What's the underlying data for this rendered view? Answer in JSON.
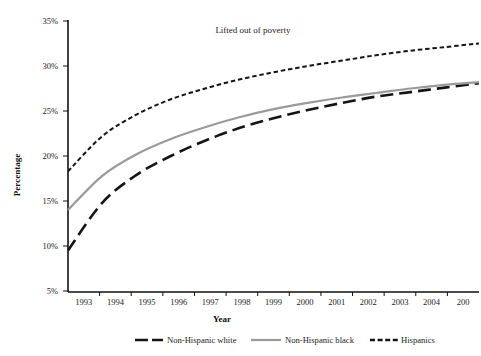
{
  "chart_data": {
    "type": "line",
    "title": "",
    "annotation": "Lifted out of poverty",
    "xlabel": "Year",
    "ylabel": "Percentage",
    "grid": false,
    "legend_position": "bottom",
    "ylim": [
      5,
      35
    ],
    "ytick_labels": [
      "35%",
      "30%",
      "25%",
      "20%",
      "15%",
      "10%",
      "5%"
    ],
    "ytick_values": [
      35,
      30,
      25,
      20,
      15,
      10,
      5
    ],
    "categories": [
      "1993",
      "1994",
      "1995",
      "1996",
      "1997",
      "1998",
      "1999",
      "2000",
      "2001",
      "2002",
      "2003",
      "2004",
      "2005"
    ],
    "xtick_labels": [
      "1993",
      "1994",
      "1995",
      "1996",
      "1997",
      "1998",
      "1999",
      "2000",
      "2001",
      "2002",
      "2003",
      "2004",
      "200"
    ],
    "series": [
      {
        "name": "Non-Hispanic white",
        "style": "dashed-thick",
        "color": "#151515",
        "values": [
          9.5,
          14.8,
          17.9,
          20.0,
          21.7,
          23.1,
          24.2,
          25.1,
          25.9,
          26.6,
          27.1,
          27.6,
          28.1
        ]
      },
      {
        "name": "Non-Hispanic black",
        "style": "solid",
        "color": "#9a9a9a",
        "values": [
          14.0,
          17.8,
          20.2,
          21.9,
          23.2,
          24.3,
          25.2,
          25.9,
          26.5,
          27.0,
          27.5,
          27.9,
          28.2
        ]
      },
      {
        "name": "Hispanics",
        "style": "dotted-fine",
        "color": "#151515",
        "values": [
          18.3,
          22.2,
          24.6,
          26.3,
          27.5,
          28.5,
          29.3,
          30.0,
          30.6,
          31.2,
          31.7,
          32.1,
          32.5
        ]
      }
    ]
  },
  "legend": {
    "items": [
      {
        "label": "Non-Hispanic white"
      },
      {
        "label": "Non-Hispanic black"
      },
      {
        "label": "Hispanics"
      }
    ]
  }
}
